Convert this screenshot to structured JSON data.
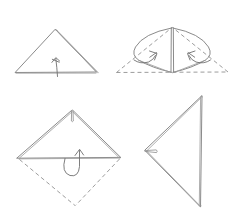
{
  "document": {
    "title": "Origami Folding Instructions",
    "kind": "line-art diagram",
    "panel_count": 4,
    "grid": "2 columns x 2 rows",
    "background_color": "#ffffff",
    "line_color": "#7d7d7d",
    "dashed_line_color": "#8a8a8a",
    "arrow_color": "#6f6f6f"
  },
  "panels": [
    {
      "id": "panel-1",
      "position": "top-left",
      "shape": "triangle",
      "description": "Wide isosceles triangle with apex up, showing a doubled edge along the right slope",
      "arrow": {
        "type": "straight-fold-arrow",
        "direction": "up",
        "label": ""
      },
      "has_dashed_lines": false
    },
    {
      "id": "panel-2",
      "position": "top-right",
      "shape": "triangle-with-folded-flaps",
      "description": "Triangle with two curved flaps folded upward toward a vertical center crease; dashed base line marks the original edge",
      "arrow": {
        "type": "curved-fold-arrow-pair",
        "direction": "up-inward",
        "label": ""
      },
      "has_dashed_lines": true
    },
    {
      "id": "panel-3",
      "position": "bottom-left",
      "shape": "diamond",
      "description": "Square rotated to a diamond; upper half solid with a narrow sliver at the top vertex, lower half dashed",
      "arrow": {
        "type": "u-turn-fold-arrow",
        "direction": "fold-back-up",
        "label": ""
      },
      "has_dashed_lines": true
    },
    {
      "id": "panel-4",
      "position": "bottom-right",
      "shape": "triangle",
      "description": "Right triangle pointing left with a small pinched sliver at the left vertex",
      "arrow": null,
      "has_dashed_lines": false
    }
  ]
}
